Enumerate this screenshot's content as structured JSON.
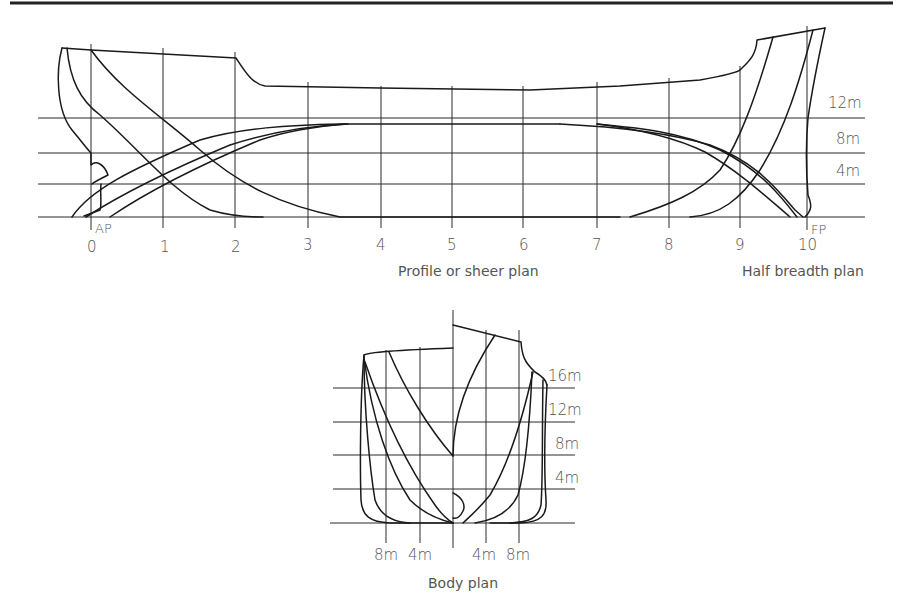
{
  "profile": {
    "caption": "Profile or sheer plan",
    "stations": [
      "0",
      "1",
      "2",
      "3",
      "4",
      "5",
      "6",
      "7",
      "8",
      "9",
      "10"
    ],
    "ap_label": "AP",
    "fp_label": "FP",
    "waterlines": [
      "12m",
      "8m",
      "4m"
    ]
  },
  "half_breadth": {
    "caption": "Half breadth plan"
  },
  "body_plan": {
    "caption": "Body plan",
    "waterlines": [
      "16m",
      "12m",
      "8m",
      "4m"
    ],
    "buttocks": [
      "8m",
      "4m",
      "4m",
      "8m"
    ]
  }
}
